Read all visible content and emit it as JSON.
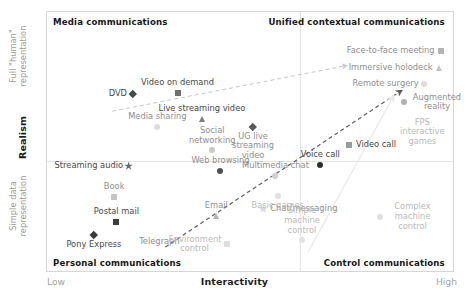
{
  "chart_data": {
    "type": "scatter",
    "title": "",
    "xlabel": "Interactivity",
    "ylabel": "Realism",
    "x_extremes": {
      "low": "Low",
      "high": "High"
    },
    "y_extremes": {
      "high": "Full \"human\"\nrepresentation",
      "high_line1": "Full \"human\"",
      "high_line2": "representation",
      "low_line1": "Simple data",
      "low_line2": "representation"
    },
    "xlim": [
      0,
      100
    ],
    "ylim": [
      0,
      100
    ],
    "grid": false,
    "legend": "none",
    "quadrant_labels": [
      {
        "name": "media-communications",
        "text": "Media communications",
        "x": 1.5,
        "y": 96
      },
      {
        "name": "unified-contextual-communications",
        "text": "Unified contextual communications",
        "x": 98,
        "y": 96
      },
      {
        "name": "personal-communications",
        "text": "Personal communications",
        "x": 1.5,
        "y": 4
      },
      {
        "name": "control-communications",
        "text": "Control communications",
        "x": 98,
        "y": 4
      }
    ],
    "dividers": {
      "vertical_x": 62,
      "horizontal_y": 43
    },
    "points": [
      {
        "label": "DVD",
        "x": 21.0,
        "y": 68.5,
        "marker": "diamond",
        "color": "#4a4a4a",
        "label_pos": "left",
        "tone": "dark"
      },
      {
        "label": "Video on demand",
        "x": 32.0,
        "y": 69.0,
        "marker": "square",
        "color": "#6f6f6f",
        "label_pos": "above",
        "tone": "dark"
      },
      {
        "label": "Live streaming video",
        "x": 38.0,
        "y": 59.0,
        "marker": "triangle",
        "color": "#7d7d7d",
        "label_pos": "above",
        "tone": "dark"
      },
      {
        "label": "UG live streaming video",
        "x": 50.5,
        "y": 56.0,
        "marker": "diamond",
        "color": "#5a5a5a",
        "label_pos": "below",
        "tone": "mid"
      },
      {
        "label": "Media sharing",
        "x": 27.0,
        "y": 56.0,
        "marker": "circle",
        "color": "#dcdcdc",
        "label_pos": "above",
        "tone": "mid"
      },
      {
        "label": "Social networking",
        "x": 40.5,
        "y": 47.0,
        "marker": "circle",
        "color": "#c9c9c9",
        "label_pos": "above",
        "tone": "mid"
      },
      {
        "label": "Streaming audio",
        "x": 20.0,
        "y": 41.0,
        "marker": "star",
        "color": "#6b6b6b",
        "label_pos": "left",
        "tone": "dark"
      },
      {
        "label": "Web browsing",
        "x": 42.5,
        "y": 39.0,
        "marker": "circle",
        "color": "#4f4f4f",
        "label_pos": "above",
        "tone": "mid"
      },
      {
        "label": "Video call",
        "x": 74.0,
        "y": 49.0,
        "marker": "square",
        "color": "#9a9a9a",
        "label_pos": "right",
        "tone": "dark"
      },
      {
        "label": "Voice call",
        "x": 67.0,
        "y": 41.5,
        "marker": "circle",
        "color": "#2e2e2e",
        "label_pos": "above",
        "tone": "dark"
      },
      {
        "label": "Multimedia chat",
        "x": 56.0,
        "y": 37.0,
        "marker": "circle",
        "color": "#cfcfcf",
        "label_pos": "above",
        "tone": "mid"
      },
      {
        "label": "Book",
        "x": 16.5,
        "y": 29.0,
        "marker": "square",
        "color": "#c4c4c4",
        "label_pos": "above",
        "tone": "mid"
      },
      {
        "label": "Postal mail",
        "x": 17.0,
        "y": 19.5,
        "marker": "square",
        "color": "#3c3c3c",
        "label_pos": "above",
        "tone": "dark"
      },
      {
        "label": "Pony Express",
        "x": 11.5,
        "y": 14.5,
        "marker": "diamond",
        "color": "#3a3a3a",
        "label_pos": "below",
        "tone": "dark"
      },
      {
        "label": "Telegraph",
        "x": 27.5,
        "y": 12.0,
        "marker": "none",
        "color": "#8d8d8d",
        "label_pos": "center",
        "tone": "mid"
      },
      {
        "label": "Email",
        "x": 41.5,
        "y": 22.0,
        "marker": "triangle",
        "color": "#b0b0b0",
        "label_pos": "above",
        "tone": "mid"
      },
      {
        "label": "Chat/messaging",
        "x": 53.0,
        "y": 24.5,
        "marker": "star",
        "color": "#d8d8d8",
        "label_pos": "right",
        "tone": "mid"
      },
      {
        "label": "Basic games",
        "x": 56.5,
        "y": 29.5,
        "marker": "circle",
        "color": "#e0e0e0",
        "label_pos": "below",
        "tone": "faint"
      },
      {
        "label": "Environment control",
        "x": 44.0,
        "y": 11.0,
        "marker": "square",
        "color": "#dedede",
        "label_pos": "left",
        "tone": "faint"
      },
      {
        "label": "Simple machine control",
        "x": 62.5,
        "y": 12.5,
        "marker": "circle",
        "color": "#e2e2e2",
        "label_pos": "above",
        "tone": "faint"
      },
      {
        "label": "Complex machine control",
        "x": 81.5,
        "y": 21.5,
        "marker": "circle",
        "color": "#e0e0e0",
        "label_pos": "right",
        "tone": "faint"
      },
      {
        "label": "Face-to-face meeting",
        "x": 96.5,
        "y": 85.0,
        "marker": "square",
        "color": "#b5b5b5",
        "label_pos": "left",
        "tone": "mid"
      },
      {
        "label": "Immersive holodeck",
        "x": 96.0,
        "y": 78.5,
        "marker": "triangle",
        "color": "#c4c4c4",
        "label_pos": "left",
        "tone": "mid"
      },
      {
        "label": "Remote surgery",
        "x": 92.5,
        "y": 72.5,
        "marker": "circle",
        "color": "#dcdcdc",
        "label_pos": "left",
        "tone": "mid"
      },
      {
        "label": "Augmented reality",
        "x": 87.5,
        "y": 65.5,
        "marker": "circle",
        "color": "#b0b0b0",
        "label_pos": "right",
        "tone": "mid"
      },
      {
        "label": "FPS interactive games",
        "x": 92.0,
        "y": 54.0,
        "marker": "none",
        "color": "#d9d9d9",
        "label_pos": "center",
        "tone": "faint"
      }
    ],
    "trend_arrows": [
      {
        "name": "media-to-unified-arrow",
        "x1": 16.0,
        "y1": 62.0,
        "x2": 73.5,
        "y2": 79.5,
        "style": "dashed",
        "color": "#c6c6c6",
        "width": 1
      },
      {
        "name": "personal-to-unified-arrow",
        "x1": 29.0,
        "y1": 10.0,
        "x2": 87.0,
        "y2": 70.0,
        "style": "dashed",
        "color": "#5d5d5d",
        "width": 1.2
      },
      {
        "name": "control-to-unified-arrow",
        "x1": 64.0,
        "y1": 8.0,
        "x2": 85.0,
        "y2": 68.0,
        "style": "solid",
        "color": "#ebebeb",
        "width": 1.4
      }
    ]
  }
}
